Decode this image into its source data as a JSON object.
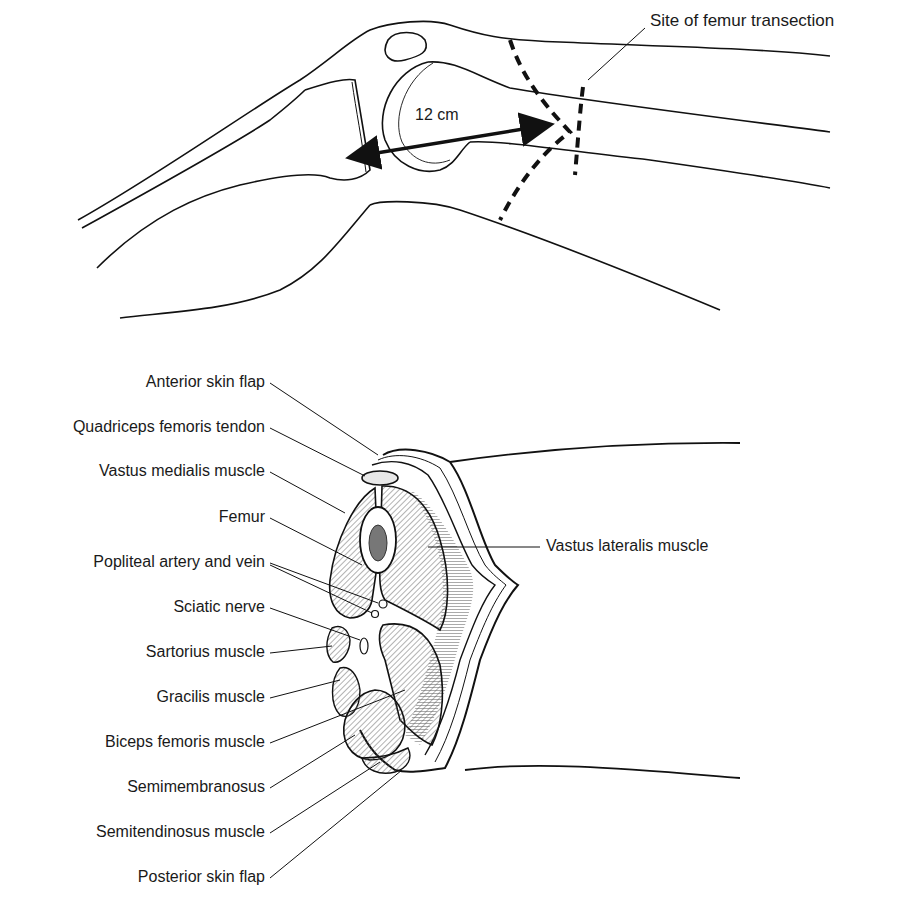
{
  "top_figure": {
    "measurement_label": "12 cm",
    "transection_label": "Site of femur transection"
  },
  "bottom_figure": {
    "left_labels": [
      {
        "text": "Anterior skin flap"
      },
      {
        "text": "Quadriceps femoris tendon"
      },
      {
        "text": "Vastus medialis muscle"
      },
      {
        "text": "Femur"
      },
      {
        "text": "Popliteal artery and vein"
      },
      {
        "text": "Sciatic nerve"
      },
      {
        "text": "Sartorius muscle"
      },
      {
        "text": "Gracilis muscle"
      },
      {
        "text": "Biceps femoris muscle"
      },
      {
        "text": "Semimembranosus"
      },
      {
        "text": "Semitendinosus muscle"
      },
      {
        "text": "Posterior skin flap"
      }
    ],
    "right_label": "Vastus lateralis muscle"
  },
  "colors": {
    "line": "#111111",
    "hatch": "#555555",
    "background": "#ffffff"
  }
}
